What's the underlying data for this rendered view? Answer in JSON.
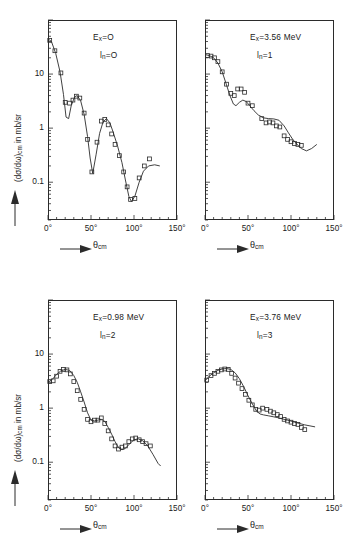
{
  "figure": {
    "axis_labels": {
      "y_text_a": "(dσ/dω)",
      "y_sub": "cm",
      "y_text_b": " in mb/sr",
      "x_text": "θ",
      "x_sub": "cm"
    },
    "y_ticks": [
      "10",
      "1",
      "0.1"
    ],
    "x_ticks": [
      "0°",
      "50°",
      "100°",
      "150°"
    ]
  },
  "chart_data": [
    {
      "type": "scatter",
      "panel": "top-left",
      "title": "",
      "annotations": [
        "E_x = 0",
        "l_n = 0"
      ],
      "label_ex_main": "E",
      "label_ex_sub": "x",
      "label_ex_val": "=O",
      "label_ln_main": "l",
      "label_ln_sub": "n",
      "label_ln_val": "=O",
      "xlabel": "θ_cm",
      "ylabel": "(dσ/dω)_cm in mb/sr",
      "xlim": [
        0,
        150
      ],
      "ylim": [
        0.02,
        100
      ],
      "yscale": "log",
      "grid": false,
      "x": [
        2,
        8,
        15,
        20,
        25,
        29,
        33,
        37,
        42,
        46,
        51,
        57,
        62,
        66,
        70,
        74,
        78,
        83,
        88,
        92,
        96,
        101,
        106,
        112,
        118
      ],
      "y": [
        42,
        27,
        10.5,
        3.0,
        2.9,
        3.3,
        3.9,
        3.6,
        1.9,
        0.62,
        0.155,
        0.55,
        1.35,
        1.45,
        1.15,
        0.78,
        0.5,
        0.31,
        0.155,
        0.082,
        0.048,
        0.05,
        0.12,
        0.2,
        0.27
      ],
      "curve_x": [
        0,
        4,
        9,
        14,
        18,
        21,
        24,
        27,
        31,
        34,
        38,
        42,
        46,
        49,
        52,
        56,
        60,
        64,
        68,
        72,
        76,
        81,
        86,
        90,
        94,
        97,
        101,
        106,
        111,
        117,
        124,
        130
      ],
      "curve_y": [
        45,
        40,
        24,
        11,
        4.2,
        1.6,
        1.5,
        2.6,
        3.8,
        4.0,
        3.2,
        1.8,
        0.7,
        0.28,
        0.145,
        0.33,
        0.8,
        1.3,
        1.5,
        1.25,
        0.82,
        0.46,
        0.23,
        0.11,
        0.055,
        0.044,
        0.055,
        0.1,
        0.16,
        0.2,
        0.21,
        0.2
      ]
    },
    {
      "type": "scatter",
      "panel": "top-right",
      "annotations": [
        "E_x = 3.56 MeV",
        "l_n = 1"
      ],
      "label_ex_main": "E",
      "label_ex_sub": "x",
      "label_ex_val": "=3.56 MeV",
      "label_ln_main": "l",
      "label_ln_sub": "n",
      "label_ln_val": "=1",
      "xlabel": "θ_cm",
      "ylabel": "",
      "xlim": [
        0,
        150
      ],
      "ylim": [
        0.02,
        100
      ],
      "yscale": "log",
      "grid": false,
      "x": [
        3,
        7,
        11,
        15,
        20,
        25,
        30,
        34,
        38,
        42,
        46,
        50,
        55,
        66,
        71,
        75,
        79,
        83,
        87,
        92,
        96,
        100,
        104,
        108,
        112
      ],
      "y": [
        22,
        21.5,
        20,
        17,
        11,
        6.5,
        4.4,
        4.0,
        5.3,
        5.3,
        4.6,
        2.9,
        2.6,
        1.5,
        1.25,
        1.3,
        1.25,
        1.1,
        1.05,
        0.72,
        0.62,
        0.56,
        0.52,
        0.5,
        0.48
      ],
      "curve_x": [
        0,
        5,
        10,
        15,
        20,
        25,
        29,
        33,
        36,
        40,
        44,
        48,
        52,
        57,
        62,
        68,
        74,
        80,
        86,
        92,
        97,
        102,
        107,
        112,
        118,
        124,
        130
      ],
      "curve_y": [
        23,
        22,
        20,
        16,
        11,
        6.3,
        4.0,
        2.8,
        2.6,
        3.0,
        3.3,
        3.1,
        2.6,
        2.1,
        1.75,
        1.55,
        1.5,
        1.48,
        1.4,
        1.1,
        0.82,
        0.62,
        0.5,
        0.42,
        0.38,
        0.42,
        0.5
      ]
    },
    {
      "type": "scatter",
      "panel": "bottom-left",
      "annotations": [
        "E_x = 0.98 MeV",
        "l_n = 2"
      ],
      "label_ex_main": "E",
      "label_ex_sub": "x",
      "label_ex_val": "=0.98 MeV",
      "label_ln_main": "l",
      "label_ln_sub": "n",
      "label_ln_val": "=2",
      "xlabel": "θ_cm",
      "ylabel": "(dσ/dω)_cm in mb/sr",
      "xlim": [
        0,
        150
      ],
      "ylim": [
        0.02,
        100
      ],
      "yscale": "log",
      "grid": false,
      "x": [
        2,
        6,
        10,
        14,
        18,
        22,
        26,
        30,
        34,
        38,
        42,
        46,
        50,
        54,
        58,
        62,
        66,
        70,
        74,
        78,
        82,
        86,
        90,
        94,
        98,
        102,
        106,
        110,
        114,
        119
      ],
      "y": [
        3.1,
        3.2,
        3.9,
        4.8,
        5.2,
        5.1,
        4.3,
        3.1,
        2.1,
        1.45,
        0.95,
        0.62,
        0.56,
        0.6,
        0.6,
        0.66,
        0.52,
        0.38,
        0.27,
        0.2,
        0.175,
        0.19,
        0.2,
        0.24,
        0.27,
        0.28,
        0.26,
        0.24,
        0.22,
        0.2
      ],
      "curve_x": [
        0,
        5,
        10,
        15,
        20,
        25,
        30,
        34,
        38,
        42,
        46,
        50,
        54,
        58,
        62,
        66,
        70,
        74,
        78,
        82,
        86,
        90,
        95,
        100,
        105,
        110,
        116,
        122,
        128,
        131
      ],
      "curve_y": [
        3.0,
        3.4,
        4.2,
        4.9,
        5.2,
        5.0,
        4.0,
        3.0,
        2.0,
        1.3,
        0.82,
        0.6,
        0.58,
        0.6,
        0.62,
        0.57,
        0.44,
        0.33,
        0.24,
        0.185,
        0.17,
        0.18,
        0.22,
        0.26,
        0.27,
        0.25,
        0.2,
        0.14,
        0.095,
        0.085
      ]
    },
    {
      "type": "scatter",
      "panel": "bottom-right",
      "annotations": [
        "E_x = 3.76 MeV",
        "l_n = 3"
      ],
      "label_ex_main": "E",
      "label_ex_sub": "x",
      "label_ex_val": "=3.76 MeV",
      "label_ln_main": "l",
      "label_ln_sub": "n",
      "label_ln_val": "=3",
      "xlabel": "θ_cm",
      "ylabel": "",
      "xlim": [
        0,
        150
      ],
      "ylim": [
        0.02,
        100
      ],
      "yscale": "log",
      "grid": false,
      "x": [
        2,
        7,
        11,
        15,
        19,
        23,
        27,
        31,
        35,
        39,
        43,
        47,
        51,
        55,
        59,
        63,
        67,
        72,
        76,
        80,
        84,
        88,
        92,
        96,
        100,
        104,
        108,
        112,
        116
      ],
      "y": [
        3.3,
        4.0,
        4.4,
        4.8,
        5.1,
        5.3,
        5.2,
        4.4,
        3.6,
        2.9,
        2.3,
        1.8,
        1.4,
        1.15,
        0.95,
        0.92,
        1.0,
        0.95,
        0.88,
        0.82,
        0.76,
        0.7,
        0.62,
        0.58,
        0.55,
        0.52,
        0.5,
        0.44,
        0.4
      ],
      "curve_x": [
        0,
        5,
        10,
        15,
        20,
        25,
        30,
        35,
        40,
        45,
        50,
        55,
        60,
        64,
        68,
        74,
        80,
        86,
        92,
        98,
        104,
        110,
        116,
        122,
        128
      ],
      "curve_y": [
        3.2,
        3.9,
        4.5,
        5.0,
        5.3,
        5.4,
        5.2,
        4.5,
        3.5,
        2.5,
        1.7,
        1.2,
        0.88,
        0.78,
        0.75,
        0.72,
        0.69,
        0.66,
        0.62,
        0.59,
        0.55,
        0.52,
        0.49,
        0.47,
        0.45
      ]
    }
  ]
}
